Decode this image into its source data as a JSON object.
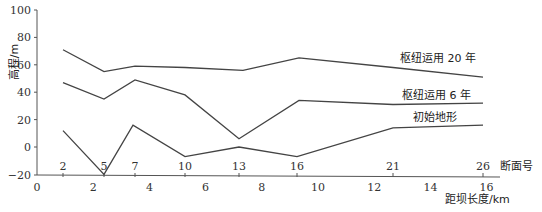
{
  "chart_data": {
    "type": "line",
    "title": "",
    "xlabel": "距坝长度/km",
    "ylabel": "高程/m",
    "secondary_xlabel": "断面号",
    "ylim": [
      -20,
      100
    ],
    "xlim": [
      0,
      16
    ],
    "y_ticks": [
      100,
      80,
      60,
      40,
      20,
      0,
      -20
    ],
    "x_ticks": [
      0,
      2,
      4,
      6,
      8,
      10,
      12,
      14,
      16
    ],
    "section_ticks": [
      2,
      5,
      7,
      10,
      13,
      16,
      21,
      26
    ],
    "grid": false,
    "categories": [
      "2",
      "5",
      "7",
      "10",
      "13",
      "16",
      "21",
      "26"
    ],
    "series": [
      {
        "name": "枢纽运用 20 年",
        "values": [
          71,
          55,
          59,
          58,
          56,
          65,
          58,
          51
        ]
      },
      {
        "name": "枢纽运用 6 年",
        "values": [
          47,
          35,
          49,
          38,
          6,
          34,
          31,
          32
        ]
      },
      {
        "name": "初始地形",
        "values": [
          12,
          -20,
          16,
          -7,
          0,
          -7,
          14,
          16
        ]
      }
    ]
  },
  "axis": {
    "y_title": "高程/m",
    "x_title": "距坝长度/km",
    "section_title": "断面号"
  },
  "labels": {
    "series_20": "枢纽运用 20 年",
    "series_6": "枢纽运用 6 年",
    "series_0": "初始地形"
  },
  "colors": {
    "line": "#444444",
    "axis": "#555555",
    "text": "#333333"
  }
}
